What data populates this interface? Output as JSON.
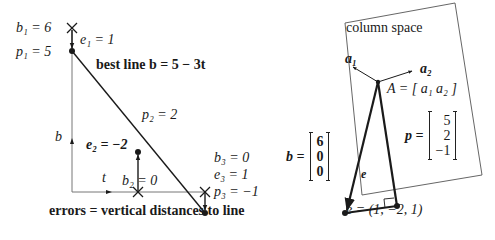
{
  "left_figure": {
    "labels": {
      "b1": "b₁ = 6",
      "p1": "p₁ = 5",
      "e1": "e₁ = 1",
      "best_line": "best line b = 5 − 3t",
      "p2": "p₂ = 2",
      "b_axis": "b",
      "e2": "e₂ = −2",
      "t_axis": "t",
      "b2": "b₂ = 0",
      "b3": "b₃ = 0",
      "e3": "e₃ = 1",
      "p3": "p₃ = −1"
    },
    "caption": "errors = vertical distances to line",
    "data": {
      "t": [
        0,
        1,
        2
      ],
      "b": [
        6,
        0,
        0
      ],
      "p": [
        5,
        2,
        -1
      ],
      "e": [
        1,
        -2,
        1
      ],
      "line": "b = 5 - 3t"
    }
  },
  "right_figure": {
    "plane_label": "column space",
    "a1": "a₁",
    "a2": "a₂",
    "A_def": "A = [ a₁  a₂ ]",
    "b_vector": {
      "label": "b =",
      "values": [
        "6",
        "0",
        "0"
      ]
    },
    "p_vector": {
      "label": "p =",
      "values": [
        "5",
        "2",
        "−1"
      ]
    },
    "e_label": "e",
    "e_def": "e = (1, −2, 1)"
  },
  "colors": {
    "ink": "#1a1a1a",
    "frame": "#555555"
  }
}
